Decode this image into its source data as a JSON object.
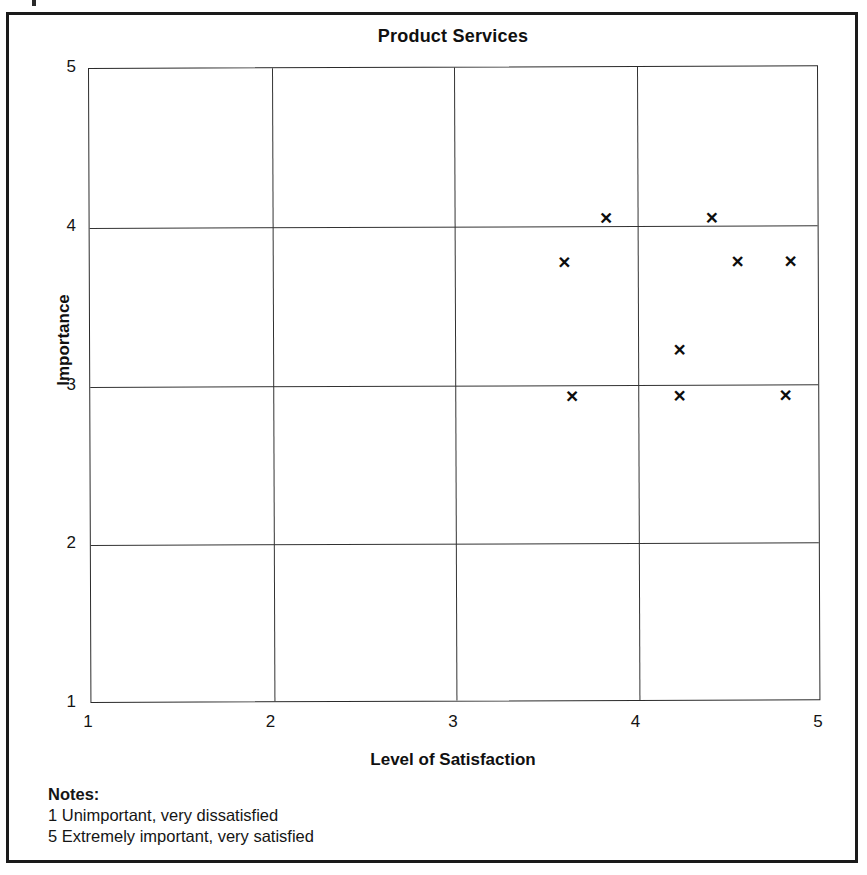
{
  "document": {
    "frame_color": "#1a1a1a",
    "background": "#ffffff"
  },
  "chart_data": {
    "type": "scatter",
    "title": "Product Services",
    "xlabel": "Level of Satisfaction",
    "ylabel": "Importance",
    "xlim": [
      1,
      5
    ],
    "ylim": [
      1,
      5
    ],
    "xticks": [
      "1",
      "2",
      "3",
      "4",
      "5"
    ],
    "yticks": [
      "5",
      "4",
      "3",
      "2",
      "1"
    ],
    "xtick_values": [
      1,
      2,
      3,
      4,
      5
    ],
    "ytick_values": [
      5,
      4,
      3,
      2,
      1
    ],
    "grid": true,
    "legend": null,
    "marker": "x",
    "marker_color": "#0d0d0d",
    "points": [
      {
        "x": 3.83,
        "y": 4.05
      },
      {
        "x": 4.41,
        "y": 4.05
      },
      {
        "x": 3.6,
        "y": 3.77
      },
      {
        "x": 4.55,
        "y": 3.77
      },
      {
        "x": 4.84,
        "y": 3.77
      },
      {
        "x": 4.23,
        "y": 3.22
      },
      {
        "x": 3.64,
        "y": 2.93
      },
      {
        "x": 4.23,
        "y": 2.93
      },
      {
        "x": 4.81,
        "y": 2.93
      }
    ],
    "marker_glyph": "×"
  },
  "notes": {
    "heading": "Notes:",
    "lines": [
      "1 Unimportant, very dissatisfied",
      "5 Extremely important, very satisfied"
    ]
  }
}
